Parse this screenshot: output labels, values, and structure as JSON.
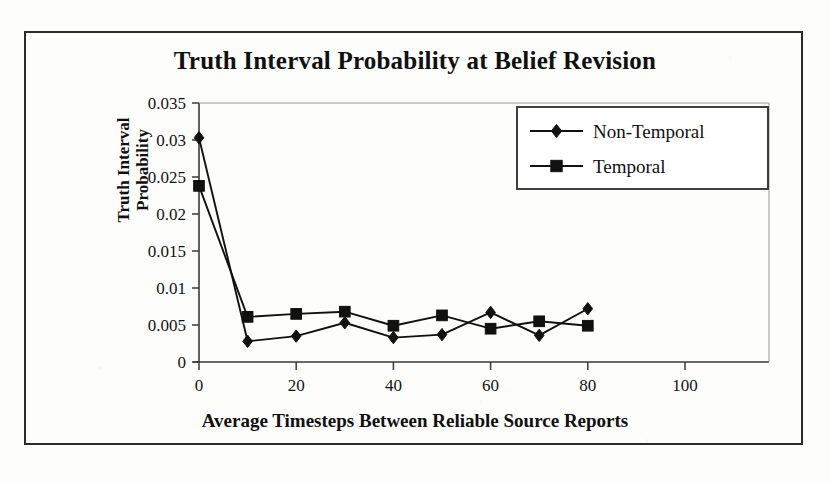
{
  "chart_data": {
    "type": "line",
    "title": "Truth Interval Probability at Belief Revision",
    "xlabel": "Average Timesteps Between Reliable Source Reports",
    "ylabel_line1": "Truth Interval",
    "ylabel_line2": "Probability",
    "x": [
      0,
      10,
      20,
      30,
      40,
      50,
      60,
      70,
      80
    ],
    "xlim": [
      0,
      100
    ],
    "ylim": [
      0,
      0.035
    ],
    "xticks": [
      "0",
      "20",
      "40",
      "60",
      "80",
      "100"
    ],
    "xtick_values": [
      0,
      20,
      40,
      60,
      80,
      100
    ],
    "yticks": [
      "0",
      "0.005",
      "0.01",
      "0.015",
      "0.02",
      "0.025",
      "0.03",
      "0.035"
    ],
    "ytick_values": [
      0,
      0.005,
      0.01,
      0.015,
      0.02,
      0.025,
      0.03,
      0.035
    ],
    "grid": false,
    "legend_position": "top-right",
    "series": [
      {
        "name": "Non-Temporal",
        "marker": "diamond",
        "color": "#111111",
        "values": [
          0.0303,
          0.0028,
          0.0035,
          0.0053,
          0.0033,
          0.0037,
          0.0067,
          0.0036,
          0.0072
        ]
      },
      {
        "name": "Temporal",
        "marker": "square",
        "color": "#111111",
        "values": [
          0.0238,
          0.0061,
          0.0065,
          0.0068,
          0.0049,
          0.0063,
          0.0045,
          0.0055,
          0.0049
        ]
      }
    ]
  },
  "legend": {
    "entries": [
      {
        "label": "Non-Temporal",
        "marker": "diamond"
      },
      {
        "label": "Temporal",
        "marker": "square"
      }
    ]
  },
  "colors": {
    "ink": "#111111",
    "axis": "#3a3a3a",
    "paper": "#fdfdfc"
  }
}
